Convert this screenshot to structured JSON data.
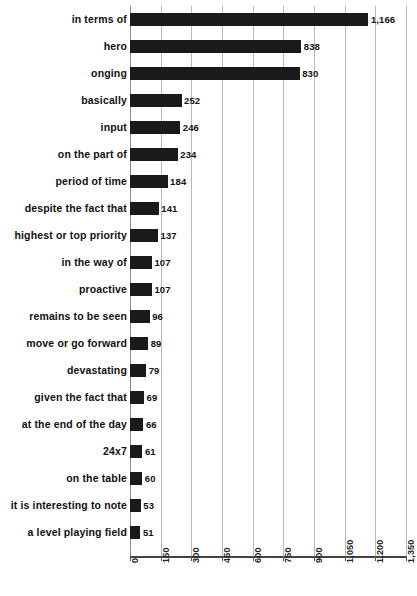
{
  "chart_data": {
    "type": "bar",
    "orientation": "horizontal",
    "title": "",
    "subtitle": "",
    "xlabel": "",
    "ylabel": "",
    "xlim": [
      0,
      1350
    ],
    "grid": true,
    "legend": null,
    "bar_color": "#1a1a1a",
    "gridline_color": "#b9b9b9",
    "background_color": "#ffffff",
    "xticks": [
      0,
      150,
      300,
      450,
      600,
      750,
      900,
      1050,
      1200,
      1350
    ],
    "xtick_labels": [
      "0",
      "150",
      "300",
      "450",
      "600",
      "750",
      "900",
      "1,050",
      "1,200",
      "1,350"
    ],
    "categories": [
      "in terms of",
      "hero",
      "onging",
      "basically",
      "input",
      "on the part of",
      "period of time",
      "despite the fact that",
      "highest or top priority",
      "in the way of",
      "proactive",
      "remains to be seen",
      "move or go forward",
      "devastating",
      "given the fact that",
      "at the end of the day",
      "24x7",
      "on the table",
      "it is interesting to note",
      "a level playing field"
    ],
    "values": [
      1166,
      838,
      830,
      252,
      246,
      234,
      184,
      141,
      137,
      107,
      107,
      96,
      89,
      79,
      69,
      66,
      61,
      60,
      53,
      51
    ],
    "value_labels": [
      "1,166",
      "838",
      "830",
      "252",
      "246",
      "234",
      "184",
      "141",
      "137",
      "107",
      "107",
      "96",
      "89",
      "79",
      "69",
      "66",
      "61",
      "60",
      "53",
      "51"
    ]
  }
}
